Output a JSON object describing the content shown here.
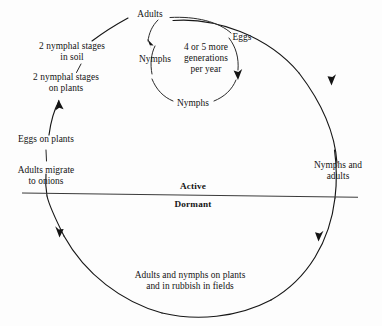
{
  "diagram": {
    "type": "cycle-diagram",
    "background_color": "#fdfdfd",
    "ink_color": "#141414",
    "divider": {
      "above_label": "Active",
      "below_label": "Dormant"
    },
    "outer_cycle": {
      "direction": "clockwise",
      "labels": {
        "top": "Adults",
        "upper_left_1": "2 nymphal stages\nin soil",
        "upper_left_2": "2 nymphal stages\non plants",
        "left_upper": "Eggs on plants",
        "left_lower": "Adults migrate\nto onions",
        "right": "Nymphs and\nadults",
        "bottom": "Adults and nymphs on plants\nand in rubbish in fields"
      }
    },
    "inner_cycle": {
      "direction": "clockwise",
      "center_note": "4 or 5 more\ngenerations\nper year",
      "labels": {
        "top_right": "Eggs",
        "left": "Nymphs",
        "bottom": "Nymphs"
      }
    }
  }
}
